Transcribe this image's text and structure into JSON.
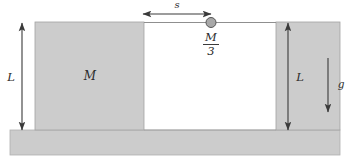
{
  "figure": {
    "background_color": "#ffffff",
    "region_fill": "#cccccc",
    "region_stroke": "#9a9a9a",
    "line_color": "#3a3a3a",
    "ball_fill": "#a8a8a8",
    "ball_stroke": "#555555"
  },
  "labels": {
    "distance_s": "s",
    "block_mass": "M",
    "ball_mass_numerator": "M",
    "ball_mass_denominator": "3",
    "height_left": "L",
    "height_right": "L",
    "gravity": "g"
  },
  "geometry": {
    "left_block": {
      "x": 35,
      "y": 22,
      "width": 109,
      "height": 108
    },
    "gap": {
      "x": 144,
      "y": 22,
      "width": 132,
      "height": 108
    },
    "right_wall": {
      "x": 276,
      "y": 22,
      "width": 64,
      "height": 108
    },
    "ground": {
      "x": 10,
      "y": 130,
      "width": 330,
      "height": 25
    },
    "ball": {
      "cx": 211,
      "cy": 23,
      "r": 5
    },
    "s_arrow": {
      "x1": 143,
      "x2": 211,
      "y": 14
    },
    "left_L_arrow": {
      "x": 22,
      "y1": 23,
      "y2": 130
    },
    "right_L_arrow": {
      "x": 288,
      "y1": 23,
      "y2": 130
    },
    "g_arrow": {
      "x": 328,
      "y1": 58,
      "y2": 112
    }
  }
}
